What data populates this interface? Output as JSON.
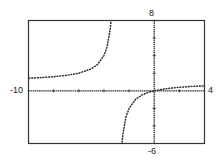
{
  "chart_data": {
    "type": "line",
    "title": "",
    "xlabel": "",
    "ylabel": "",
    "xlim": [
      -10,
      4
    ],
    "ylim": [
      -6,
      8
    ],
    "grid": false,
    "legend": null,
    "x_tick_step": 2,
    "y_tick_step": 2,
    "window_labels": {
      "xmin": "-10",
      "xmax": "4",
      "ymin": "-6",
      "ymax": "8"
    },
    "function": "y = x / (x + 3)",
    "vertical_asymptote": -3,
    "horizontal_asymptote": 1,
    "series": [
      {
        "name": "left branch",
        "x": [
          -10,
          -9,
          -8,
          -7,
          -6,
          -5,
          -4.5,
          -4,
          -3.75,
          -3.5,
          -3.4,
          -3.3,
          -3.25
        ],
        "y": [
          1.43,
          1.5,
          1.6,
          1.75,
          2.0,
          2.5,
          3.0,
          4.0,
          5.0,
          7.0,
          8.5,
          11,
          13
        ]
      },
      {
        "name": "right branch",
        "x": [
          -2.75,
          -2.7,
          -2.6,
          -2.5,
          -2.25,
          -2,
          -1.5,
          -1,
          -0.5,
          0,
          1,
          2,
          3,
          4
        ],
        "y": [
          -11,
          -9,
          -6.5,
          -5,
          -3,
          -2,
          -1,
          -0.5,
          -0.2,
          0,
          0.25,
          0.4,
          0.5,
          0.57
        ]
      }
    ],
    "color": "#222222"
  }
}
